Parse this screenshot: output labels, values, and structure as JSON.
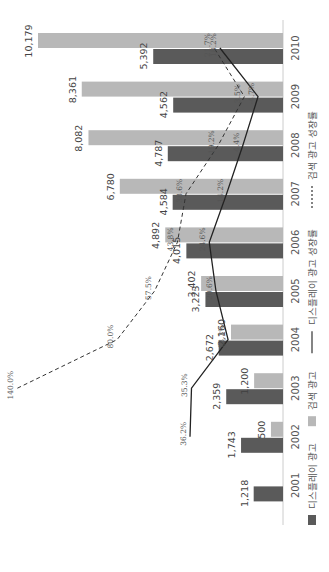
{
  "chart_data": {
    "type": "bar",
    "orientation": "rotated-90-clockwise",
    "title": "",
    "categories": [
      "2001",
      "2002",
      "2003",
      "2004",
      "2005",
      "2006",
      "2007",
      "2008",
      "2009",
      "2010"
    ],
    "series": [
      {
        "name": "디스플레이 광고",
        "kind": "bar",
        "color": "#5a5a5a",
        "values": [
          1218,
          1743,
          2359,
          2672,
          3223,
          4015,
          4584,
          4787,
          4562,
          5392
        ],
        "labels": [
          "1,218",
          "1,743",
          "2,359",
          "2,672",
          "3,223",
          "4,015",
          "4,584",
          "4,787",
          "4,562",
          "5,392"
        ]
      },
      {
        "name": "검색 광고",
        "kind": "bar",
        "color": "#b8b8b8",
        "values": [
          null,
          500,
          1200,
          2160,
          3402,
          4892,
          6780,
          8082,
          8361,
          10179
        ],
        "labels": [
          null,
          "500",
          "1,200",
          "2,160",
          "3,402",
          "4,892",
          "6,780",
          "8,082",
          "8,361",
          "10,179"
        ]
      },
      {
        "name": "디스플레이 광고 성장률",
        "kind": "line",
        "style": "solid",
        "color": "#222222",
        "values": [
          null,
          36.2,
          35.3,
          13.3,
          20.6,
          24.6,
          14.2,
          4.4,
          -4.7,
          18.2
        ],
        "labels": [
          null,
          "36.2%",
          "35.3%",
          "13.3%",
          "20.6%",
          "24.6%",
          "14.2%",
          "4.4%",
          "-4.7%",
          "18.2%"
        ]
      },
      {
        "name": "검색 광고 성장률",
        "kind": "line",
        "style": "dashed",
        "color": "#333333",
        "values": [
          null,
          null,
          140.0,
          80.0,
          57.5,
          43.8,
          38.6,
          19.2,
          3.5,
          21.7
        ],
        "labels": [
          null,
          null,
          "140.0%",
          "80.0%",
          "57.5%",
          "43.8%",
          "38.6%",
          "19.2%",
          "3.5%",
          "21.7%"
        ]
      }
    ],
    "xlabel": "",
    "ylabel": "",
    "ylim": [
      0,
      10179
    ],
    "grid": false,
    "legend_position": "bottom"
  },
  "legend": [
    {
      "label": "디스플레이 광고",
      "type": "dark-square"
    },
    {
      "label": "검색 광고",
      "type": "light-square"
    },
    {
      "label": "디스플레이 광고 성장률",
      "type": "solid-line"
    },
    {
      "label": "검색 광고 성장률",
      "type": "dashed-line"
    }
  ]
}
